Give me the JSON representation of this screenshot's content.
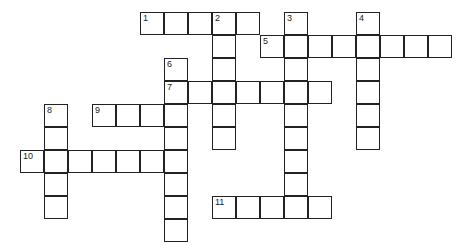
{
  "puzzle": {
    "type": "crossword",
    "cell_w": 24,
    "cell_h": 23,
    "origin_x": 20,
    "origin_y": 12,
    "clues": [
      {
        "number": "1",
        "direction": "across",
        "col": 5,
        "row": 0,
        "length": 5
      },
      {
        "number": "2",
        "direction": "down",
        "col": 8,
        "row": 0,
        "length": 6
      },
      {
        "number": "3",
        "direction": "down",
        "col": 11,
        "row": 0,
        "length": 9
      },
      {
        "number": "4",
        "direction": "down",
        "col": 14,
        "row": 0,
        "length": 6
      },
      {
        "number": "5",
        "direction": "across",
        "col": 10,
        "row": 1,
        "length": 8
      },
      {
        "number": "6",
        "direction": "down",
        "col": 6,
        "row": 2,
        "length": 8
      },
      {
        "number": "7",
        "direction": "across",
        "col": 6,
        "row": 3,
        "length": 7
      },
      {
        "number": "8",
        "direction": "down",
        "col": 1,
        "row": 4,
        "length": 5
      },
      {
        "number": "9",
        "direction": "across",
        "col": 3,
        "row": 4,
        "length": 4
      },
      {
        "number": "10",
        "direction": "across",
        "col": 0,
        "row": 6,
        "length": 7
      },
      {
        "number": "11",
        "direction": "across",
        "col": 8,
        "row": 8,
        "length": 5
      }
    ]
  }
}
